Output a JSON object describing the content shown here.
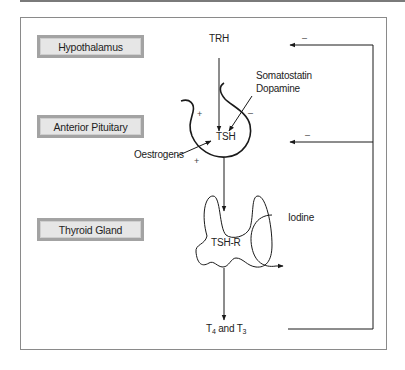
{
  "diagram": {
    "title": "",
    "organs": [
      {
        "id": "hypothalamus",
        "label": "Hypothalamus"
      },
      {
        "id": "anterior-pituitary",
        "label": "Anterior Pituitary"
      },
      {
        "id": "thyroid-gland",
        "label": "Thyroid Gland"
      }
    ],
    "labels": {
      "trh": "TRH",
      "somatostatin": "Somatostatin",
      "dopamine": "Dopamine",
      "tsh": "TSH",
      "oestrogens": "Oestrogens",
      "tsh_r": "TSH-R",
      "iodine": "Iodine",
      "t4": "T",
      "t4_sub": "4",
      "and": " and T",
      "t3_sub": "3"
    },
    "signs": {
      "plus_upper": "+",
      "plus_lower": "+",
      "minus_pituitary": "–",
      "minus_feedback_top": "–",
      "minus_feedback_mid": "–"
    },
    "edges": [
      {
        "from": "Hypothalamus",
        "to": "Anterior Pituitary",
        "label": "TRH",
        "effect": "+"
      },
      {
        "from": "Somatostatin / Dopamine",
        "to": "Anterior Pituitary",
        "effect": "–"
      },
      {
        "from": "Oestrogens",
        "to": "Anterior Pituitary",
        "effect": "+"
      },
      {
        "from": "Anterior Pituitary",
        "to": "Thyroid Gland",
        "label": "TSH"
      },
      {
        "from": "Iodine",
        "to": "Thyroid Gland"
      },
      {
        "from": "Thyroid Gland",
        "to": "T4 and T3"
      },
      {
        "from": "T4 and T3",
        "to": "Hypothalamus",
        "effect": "–",
        "type": "feedback"
      },
      {
        "from": "T4 and T3",
        "to": "Anterior Pituitary",
        "effect": "–",
        "type": "feedback"
      }
    ],
    "colors": {
      "box_fill": "#e6e6e6",
      "box_border": "#a3a3a3",
      "line": "#222222"
    }
  }
}
